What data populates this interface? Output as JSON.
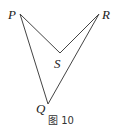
{
  "figure": {
    "caption": "图 10",
    "points": {
      "P": {
        "label": "P",
        "x": 20,
        "y": 14
      },
      "R": {
        "label": "R",
        "x": 99,
        "y": 14
      },
      "S": {
        "label": "S",
        "x": 60,
        "y": 53
      },
      "Q": {
        "label": "Q",
        "x": 48,
        "y": 104
      }
    },
    "segments": [
      "PS",
      "SR",
      "PQ",
      "QR"
    ],
    "line_color": "#444444"
  }
}
